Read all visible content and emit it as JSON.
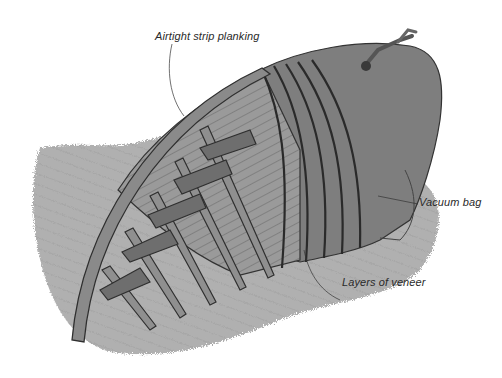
{
  "diagram": {
    "labels": {
      "planking": "Airtight strip planking",
      "vacuum_bag": "Vacuum bag",
      "veneer": "Layers of veneer"
    },
    "colors": {
      "background": "#ffffff",
      "shadow": "#9a9a9a",
      "bag": "#7e7e7e",
      "planking": "#8c8c8c",
      "frame": "#6a6a6a",
      "ink": "#222222"
    }
  }
}
